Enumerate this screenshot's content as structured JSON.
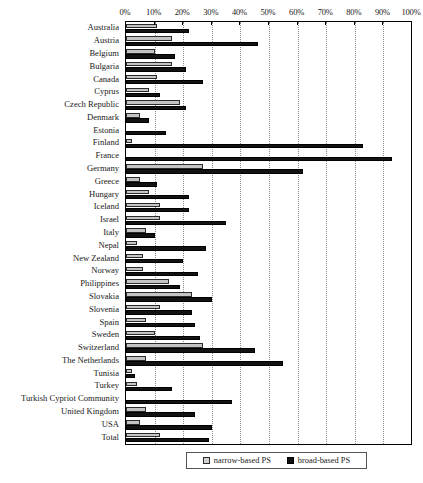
{
  "chart_data": {
    "type": "bar",
    "orientation": "horizontal",
    "title": "",
    "xlabel": "",
    "ylabel": "",
    "xlim": [
      0,
      100
    ],
    "xticks": [
      "0%",
      "10%",
      "20%",
      "30%",
      "40%",
      "50%",
      "60%",
      "70%",
      "80%",
      "90%",
      "100%"
    ],
    "xtick_values": [
      0,
      10,
      20,
      30,
      40,
      50,
      60,
      70,
      80,
      90,
      100
    ],
    "grid": true,
    "legend_position": "bottom",
    "categories": [
      "Australia",
      "Austria",
      "Belgium",
      "Bulgaria",
      "Canada",
      "Cyprus",
      "Czech Republic",
      "Denmark",
      "Estonia",
      "Finland",
      "France",
      "Germany",
      "Greece",
      "Hungary",
      "Iceland",
      "Israel",
      "Italy",
      "Nepal",
      "New Zealand",
      "Norway",
      "Philippines",
      "Slovakia",
      "Slovenia",
      "Spain",
      "Sweden",
      "Switzerland",
      "The Netherlands",
      "Tunisia",
      "Turkey",
      "Turkish Cypriot Community",
      "United Kingdom",
      "USA",
      "Total"
    ],
    "series": [
      {
        "name": "narrow-based PS",
        "color": "#c4c4c4",
        "values": [
          11,
          16,
          10,
          16,
          11,
          8,
          19,
          5,
          0,
          2,
          0,
          27,
          5,
          8,
          12,
          12,
          7,
          4,
          6,
          6,
          15,
          23,
          12,
          7,
          10,
          27,
          7,
          2,
          4,
          0,
          7,
          5,
          12
        ]
      },
      {
        "name": "broad-based PS",
        "color": "#121212",
        "values": [
          22,
          46,
          17,
          21,
          27,
          12,
          21,
          8,
          14,
          83,
          93,
          62,
          11,
          22,
          22,
          35,
          10,
          28,
          20,
          25,
          19,
          30,
          23,
          24,
          26,
          45,
          55,
          3,
          16,
          37,
          24,
          30,
          29
        ]
      }
    ]
  },
  "legend": {
    "entries": [
      {
        "label": "narrow-based PS"
      },
      {
        "label": "broad-based PS"
      }
    ]
  },
  "colors": {
    "narrow": "#c4c4c4",
    "broad": "#121212",
    "grid": "#8a8a8a",
    "frame": "#000000",
    "background": "#ffffff"
  }
}
